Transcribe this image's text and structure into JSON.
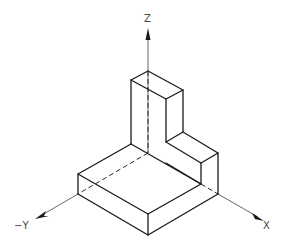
{
  "diagram": {
    "type": "isometric-view",
    "axes": [
      {
        "name": "z-axis",
        "label": "Z"
      },
      {
        "name": "x-axis",
        "label": "X"
      },
      {
        "name": "neg-y-axis",
        "label": "−Y"
      }
    ],
    "colors": {
      "line": "#1a1a1a",
      "axis": "#555555",
      "label": "#444444",
      "background": "#ffffff"
    }
  }
}
